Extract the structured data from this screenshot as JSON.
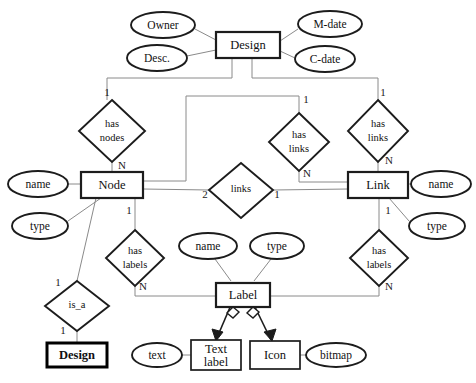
{
  "diagram": {
    "type": "entity-relationship-diagram",
    "entities": [
      {
        "id": "design_top",
        "label": "Design",
        "x": 248,
        "y": 45,
        "w": 64,
        "h": 26,
        "weight": "normal"
      },
      {
        "id": "node",
        "label": "Node",
        "x": 112,
        "y": 185,
        "w": 62,
        "h": 26,
        "weight": "normal"
      },
      {
        "id": "link",
        "label": "Link",
        "x": 378,
        "y": 185,
        "w": 60,
        "h": 26,
        "weight": "normal"
      },
      {
        "id": "label",
        "label": "Label",
        "x": 243,
        "y": 293,
        "w": 54,
        "h": 24,
        "weight": "normal"
      },
      {
        "id": "design_sub",
        "label": "Design",
        "x": 77,
        "y": 355,
        "w": 60,
        "h": 24,
        "weight": "bold"
      },
      {
        "id": "text_label",
        "label": "Text label",
        "x": 216,
        "y": 355,
        "w": 50,
        "h": 30,
        "weight": "normal"
      },
      {
        "id": "icon",
        "label": "Icon",
        "x": 275,
        "y": 355,
        "w": 50,
        "h": 28,
        "weight": "normal"
      }
    ],
    "attributes": [
      {
        "id": "owner",
        "label": "Owner",
        "x": 163,
        "y": 25,
        "rx": 32,
        "ry": 13,
        "owner": "design_top"
      },
      {
        "id": "desc",
        "label": "Desc.",
        "x": 157,
        "y": 58,
        "rx": 30,
        "ry": 13,
        "owner": "design_top"
      },
      {
        "id": "mdate",
        "label": "M-date",
        "x": 330,
        "y": 24,
        "rx": 32,
        "ry": 13,
        "owner": "design_top"
      },
      {
        "id": "cdate",
        "label": "C-date",
        "x": 325,
        "y": 59,
        "rx": 30,
        "ry": 13,
        "owner": "design_top"
      },
      {
        "id": "n_name",
        "label": "name",
        "x": 38,
        "y": 184,
        "rx": 30,
        "ry": 13,
        "owner": "node"
      },
      {
        "id": "n_type",
        "label": "type",
        "x": 40,
        "y": 226,
        "rx": 28,
        "ry": 13,
        "owner": "node"
      },
      {
        "id": "l_name",
        "label": "name",
        "x": 441,
        "y": 184,
        "rx": 30,
        "ry": 13,
        "owner": "link"
      },
      {
        "id": "l_type",
        "label": "type",
        "x": 437,
        "y": 226,
        "rx": 28,
        "ry": 13,
        "owner": "link"
      },
      {
        "id": "lb_name",
        "label": "name",
        "x": 208,
        "y": 246,
        "rx": 29,
        "ry": 13,
        "owner": "label"
      },
      {
        "id": "lb_type",
        "label": "type",
        "x": 277,
        "y": 246,
        "rx": 27,
        "ry": 13,
        "owner": "label"
      },
      {
        "id": "text",
        "label": "text",
        "x": 157,
        "y": 355,
        "rx": 25,
        "ry": 12,
        "owner": "text_label"
      },
      {
        "id": "bitmap",
        "label": "bitmap",
        "x": 336,
        "y": 355,
        "rx": 30,
        "ry": 12,
        "owner": "icon"
      }
    ],
    "relationships": [
      {
        "id": "has_nodes",
        "lines": [
          "has",
          "nodes"
        ],
        "x": 112,
        "y": 131,
        "rx": 33,
        "ry": 31
      },
      {
        "id": "has_links_l",
        "lines": [
          "has",
          "links"
        ],
        "x": 299,
        "y": 142,
        "rx": 30,
        "ry": 29
      },
      {
        "id": "has_links_r",
        "lines": [
          "has",
          "links"
        ],
        "x": 378,
        "y": 131,
        "rx": 30,
        "ry": 31
      },
      {
        "id": "links_mid",
        "lines": [
          "links"
        ],
        "x": 241,
        "y": 191,
        "rx": 32,
        "ry": 28
      },
      {
        "id": "has_labels_l",
        "lines": [
          "has",
          "labels"
        ],
        "x": 135,
        "y": 258,
        "rx": 29,
        "ry": 28
      },
      {
        "id": "has_labels_r",
        "lines": [
          "has",
          "labels"
        ],
        "x": 379,
        "y": 258,
        "rx": 29,
        "ry": 28
      },
      {
        "id": "is_a",
        "lines": [
          "is_a"
        ],
        "x": 77,
        "y": 306,
        "rx": 32,
        "ry": 25
      }
    ],
    "cardinalities": [
      {
        "id": "c1",
        "label": "1",
        "x": 107,
        "y": 93
      },
      {
        "id": "c2",
        "label": "N",
        "x": 122,
        "y": 166
      },
      {
        "id": "c3",
        "label": "1",
        "x": 306,
        "y": 100
      },
      {
        "id": "c4",
        "label": "N",
        "x": 307,
        "y": 174
      },
      {
        "id": "c5",
        "label": "1",
        "x": 383,
        "y": 93
      },
      {
        "id": "c6",
        "label": "N",
        "x": 389,
        "y": 161
      },
      {
        "id": "c7",
        "label": "2",
        "x": 205,
        "y": 195
      },
      {
        "id": "c8",
        "label": "1",
        "x": 277,
        "y": 195
      },
      {
        "id": "c9",
        "label": "1",
        "x": 129,
        "y": 211
      },
      {
        "id": "c10",
        "label": "N",
        "x": 143,
        "y": 287
      },
      {
        "id": "c11",
        "label": "1",
        "x": 388,
        "y": 211
      },
      {
        "id": "c12",
        "label": "N",
        "x": 389,
        "y": 287
      },
      {
        "id": "c13",
        "label": "1",
        "x": 58,
        "y": 283
      },
      {
        "id": "c14",
        "label": "1",
        "x": 63,
        "y": 331
      }
    ],
    "inheritance": [
      {
        "id": "label-to-text-label",
        "from": "label",
        "to": "text_label"
      },
      {
        "id": "label-to-icon",
        "from": "label",
        "to": "icon"
      }
    ],
    "colors": {
      "background": "#ffffff",
      "shape_stroke": "#1c1c1c",
      "connector_stroke": "#8a8a8a",
      "text": "#111111"
    }
  }
}
